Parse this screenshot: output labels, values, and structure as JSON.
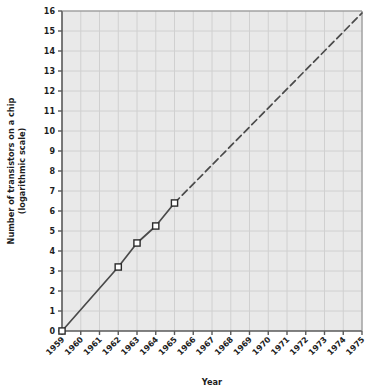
{
  "chart_data": {
    "type": "line",
    "title": "",
    "xlabel": "Year",
    "ylabel_line1": "Number of transistors on a chip",
    "ylabel_line2": "(logarithmic scale)",
    "xlim": [
      1959,
      1975
    ],
    "ylim": [
      0,
      16
    ],
    "grid": true,
    "legend": "none",
    "yticks": [
      "16",
      "15",
      "14",
      "13",
      "12",
      "11",
      "10",
      "9",
      "8",
      "7",
      "6",
      "5",
      "4",
      "3",
      "2",
      "1",
      "0"
    ],
    "ytick_values": [
      16,
      15,
      14,
      13,
      12,
      11,
      10,
      9,
      8,
      7,
      6,
      5,
      4,
      3,
      2,
      1,
      0
    ],
    "xticks": [
      "1959",
      "1960",
      "1961",
      "1962",
      "1963",
      "1964",
      "1965",
      "1966",
      "1967",
      "1968",
      "1969",
      "1970",
      "1971",
      "1972",
      "1973",
      "1974",
      "1975"
    ],
    "xtick_values": [
      1959,
      1960,
      1961,
      1962,
      1963,
      1964,
      1965,
      1966,
      1967,
      1968,
      1969,
      1970,
      1971,
      1972,
      1973,
      1974,
      1975
    ],
    "xtick_rotation": -45,
    "series": [
      {
        "name": "observed",
        "style": "solid",
        "marker": "open-square",
        "x": [
          1959,
          1962,
          1963,
          1964,
          1965
        ],
        "values": [
          0,
          3.2,
          4.4,
          5.25,
          6.4
        ]
      },
      {
        "name": "projected",
        "style": "dashed",
        "marker": "none",
        "x": [
          1965,
          1975
        ],
        "values": [
          6.4,
          15.9
        ]
      }
    ],
    "colors": {
      "plot_background": "#e9e9e9",
      "gridline": "#d0d0d0",
      "axis": "#595959",
      "line": "#4a4a4a",
      "marker_fill": "#ffffff",
      "marker_edge": "#2b2b2b",
      "text": "#1d1d1d",
      "page_background": "#ffffff"
    }
  }
}
